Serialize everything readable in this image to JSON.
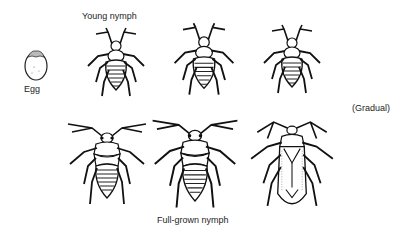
{
  "diagram": {
    "type_label": "(Gradual)",
    "stages": [
      {
        "id": "egg",
        "label": "Egg"
      },
      {
        "id": "nymph-1",
        "label": "Young nymph"
      },
      {
        "id": "nymph-2",
        "label": ""
      },
      {
        "id": "nymph-3",
        "label": ""
      },
      {
        "id": "nymph-4",
        "label": ""
      },
      {
        "id": "nymph-5",
        "label": "Full-grown nymph"
      },
      {
        "id": "adult",
        "label": ""
      }
    ]
  }
}
